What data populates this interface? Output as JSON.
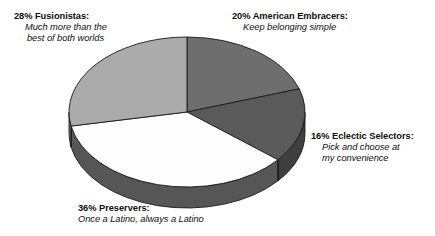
{
  "chart_data": {
    "type": "pie",
    "title": "",
    "subtitle": "",
    "xlabel": "",
    "ylabel": "",
    "legend_position": "callout-labels",
    "three_d": true,
    "start_angle_deg": 0,
    "direction": "clockwise",
    "categories": [
      "American Embracers",
      "Eclectic Selectors",
      "Preservers",
      "Fusionistas"
    ],
    "values": [
      20,
      16,
      36,
      28
    ],
    "value_unit": "percent",
    "colors": [
      "#6e6e6e",
      "#5a5a5a",
      "#fdfdfd",
      "#ababab"
    ],
    "side_colors": [
      "#4e4e4e",
      "#3f3f3f",
      "#565656",
      "#7e7e7e"
    ],
    "slices": [
      {
        "name": "American Embracers",
        "value": 20,
        "percent_label": "20%",
        "color": "#6e6e6e",
        "side_color": "#4e4e4e",
        "motto": "Keep belonging simple"
      },
      {
        "name": "Eclectic Selectors",
        "value": 16,
        "percent_label": "16%",
        "color": "#5a5a5a",
        "side_color": "#3f3f3f",
        "motto": "Pick and choose at my convenience"
      },
      {
        "name": "Preservers",
        "value": 36,
        "percent_label": "36%",
        "color": "#fdfdfd",
        "side_color": "#565656",
        "motto": "Once a Latino, always a Latino"
      },
      {
        "name": "Fusionistas",
        "value": 28,
        "percent_label": "28%",
        "color": "#ababab",
        "side_color": "#7e7e7e",
        "motto": "Much more than the best of both worlds"
      }
    ]
  },
  "labels": {
    "fusionistas": {
      "head": "28% Fusionistas:",
      "sub1": "Much more than the",
      "sub2": "best of both worlds"
    },
    "embracers": {
      "head": "20% American Embracers:",
      "sub1": "Keep belonging simple",
      "sub2": ""
    },
    "selectors": {
      "head": "16% Eclectic Selectors:",
      "sub1": "Pick and choose at",
      "sub2": "my convenience"
    },
    "preservers": {
      "head": "36% Preservers:",
      "sub1": "Once a Latino, always a Latino",
      "sub2": ""
    }
  }
}
